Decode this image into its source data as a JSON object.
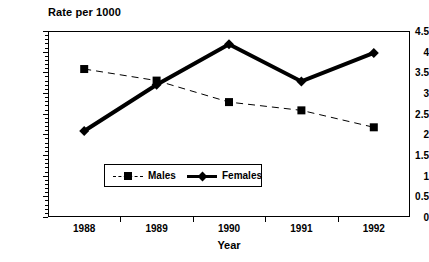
{
  "chart_data": {
    "type": "line",
    "title": "Rate per 1000",
    "xlabel": "Year",
    "ylabel": "",
    "categories": [
      "1988",
      "1989",
      "1990",
      "1991",
      "1992"
    ],
    "x": [
      1988,
      1989,
      1990,
      1991,
      1992
    ],
    "series": [
      {
        "name": "Males",
        "values": [
          3.58,
          3.3,
          2.78,
          2.58,
          2.17
        ],
        "line_style": "dashed",
        "marker": "square",
        "color": "#000000",
        "line_width": 1
      },
      {
        "name": "Females",
        "values": [
          2.08,
          3.2,
          4.18,
          3.28,
          3.97
        ],
        "line_style": "solid",
        "marker": "diamond",
        "color": "#000000",
        "line_width": 4
      }
    ],
    "ylim": [
      0,
      4.5
    ],
    "ytick_labels": [
      "0",
      "0.5",
      "1",
      "1.5",
      "2",
      "2.5",
      "3",
      "3.5",
      "4",
      "4.5"
    ],
    "ytick_values": [
      0,
      0.5,
      1,
      1.5,
      2,
      2.5,
      3,
      3.5,
      4,
      4.5
    ],
    "ystep": 0.5,
    "grid": false,
    "legend_position": "inside-lower-left",
    "legend_entries": [
      "Males",
      "Females"
    ],
    "frame": true,
    "background": "#ffffff",
    "foreground": "#000000"
  }
}
